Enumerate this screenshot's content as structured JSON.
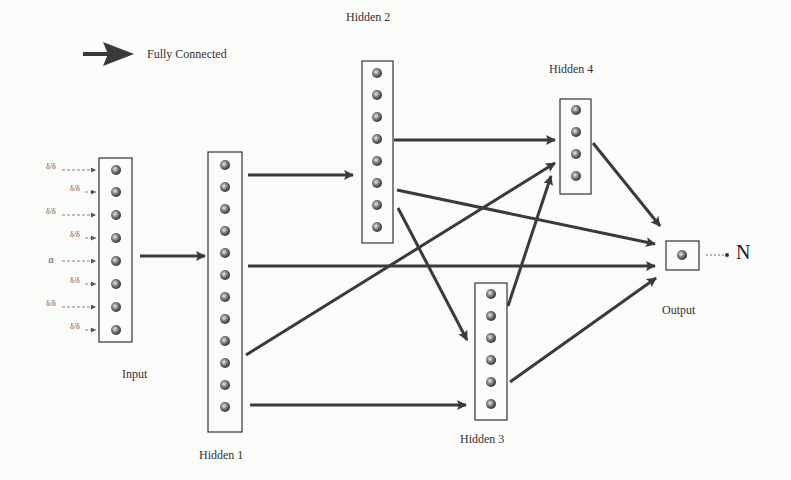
{
  "legend": {
    "arrow_label": "Fully Connected"
  },
  "layers": {
    "input": {
      "label": "Input",
      "nodes": 8
    },
    "hidden1": {
      "label": "Hidden 1",
      "nodes": 12
    },
    "hidden2": {
      "label": "Hidden 2",
      "nodes": 8
    },
    "hidden3": {
      "label": "Hidden 3",
      "nodes": 6
    },
    "hidden4": {
      "label": "Hidden 4",
      "nodes": 4
    },
    "output": {
      "label": "Output",
      "nodes": 1
    }
  },
  "output_symbol": "N",
  "input_features": [
    "δ/δ",
    "δ/δ",
    "δ/δ",
    "δ/δ",
    "α",
    "δ/δ",
    "δ/δ",
    "δ/δ"
  ],
  "connections": [
    [
      "input",
      "hidden1"
    ],
    [
      "hidden1",
      "hidden2"
    ],
    [
      "hidden1",
      "hidden4"
    ],
    [
      "hidden1",
      "output"
    ],
    [
      "hidden1",
      "hidden3"
    ],
    [
      "hidden2",
      "hidden4"
    ],
    [
      "hidden2",
      "output"
    ],
    [
      "hidden2",
      "hidden3"
    ],
    [
      "hidden3",
      "hidden4"
    ],
    [
      "hidden3",
      "output"
    ],
    [
      "hidden4",
      "output"
    ]
  ],
  "colors": {
    "arrow": "#3a3a3a",
    "node": "#555555",
    "box": "#333333"
  }
}
